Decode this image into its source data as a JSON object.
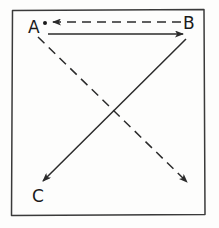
{
  "figure": {
    "background_color": "#fdfdfc",
    "stroke_color": "#2b2b2b",
    "frame": {
      "name": "hand-drawn rectangle border",
      "x": 11,
      "y": 9,
      "width": 194,
      "height": 207,
      "stroke_width": 1.4
    },
    "nodes": [
      {
        "id": "A",
        "label": "A",
        "x": 44,
        "y": 30,
        "has_dot": true
      },
      {
        "id": "B",
        "label": "B",
        "x": 188,
        "y": 27,
        "has_dot": false
      },
      {
        "id": "C",
        "label": "C",
        "x": 40,
        "y": 196,
        "has_dot": false
      }
    ],
    "arrows": [
      {
        "name": "dashed-arrow-b-to-a",
        "style": "dashed",
        "from": {
          "x": 181,
          "y": 22
        },
        "to": {
          "x": 51,
          "y": 22
        },
        "head_at": "to",
        "dash_pattern": "9 6"
      },
      {
        "name": "solid-arrow-a-to-b",
        "style": "solid",
        "from": {
          "x": 48,
          "y": 34
        },
        "to": {
          "x": 185,
          "y": 34
        },
        "head_at": "to",
        "dash_pattern": ""
      },
      {
        "name": "solid-arrow-b-to-c",
        "style": "solid",
        "from": {
          "x": 186,
          "y": 39
        },
        "to": {
          "x": 41,
          "y": 183
        },
        "head_at": "to",
        "dash_pattern": ""
      },
      {
        "name": "dashed-arrow-a-to-lower-right",
        "style": "dashed",
        "from": {
          "x": 38,
          "y": 37
        },
        "to": {
          "x": 189,
          "y": 184
        },
        "head_at": "to",
        "dash_pattern": "9 6"
      }
    ]
  }
}
